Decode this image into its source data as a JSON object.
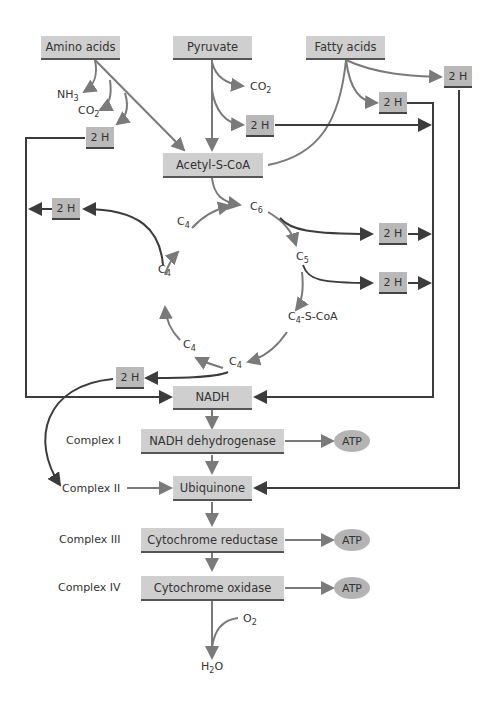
{
  "sources": {
    "amino_acids": "Amino acids",
    "pyruvate": "Pyruvate",
    "fatty_acids": "Fatty acids"
  },
  "hydrogen_label": "2 H",
  "byproducts": {
    "nh3": "NH",
    "nh3_sub": "3",
    "co2": "CO",
    "co2_sub": "2",
    "o2": "O",
    "o2_sub": "2",
    "h2o_pre": "H",
    "h2o_sub": "2",
    "h2o_post": "O"
  },
  "acetyl_coa": "Acetyl-S-CoA",
  "cycle": {
    "c6": "C",
    "c6_sub": "6",
    "c5": "C",
    "c5_sub": "5",
    "c4": "C",
    "c4_sub": "4",
    "c4_scoa_suffix": "-S-CoA"
  },
  "chain": {
    "nadh": "NADH",
    "complex1_label": "Complex I",
    "complex1": "NADH dehydrogenase",
    "complex2_label": "Complex II",
    "complex2": "Ubiquinone",
    "complex3_label": "Complex III",
    "complex3": "Cytochrome reductase",
    "complex4_label": "Complex IV",
    "complex4": "Cytochrome oxidase",
    "atp": "ATP"
  },
  "colors": {
    "box_fill": "#cfcfcf",
    "hbox_fill": "#b9b9b9",
    "arrow_gray": "#7a7a7a",
    "arrow_dark": "#3c3c3c",
    "atp_fill": "#b4b4b4"
  }
}
